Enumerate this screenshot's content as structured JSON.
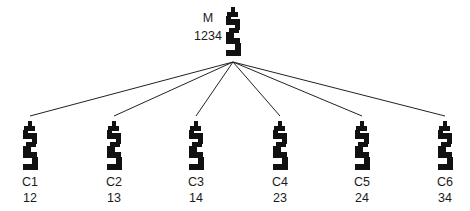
{
  "root": {
    "label": "M",
    "value": "1234",
    "icon": "segment-glyph-icon"
  },
  "children": [
    {
      "label": "C1",
      "value": "12",
      "icon": "segment-glyph-icon"
    },
    {
      "label": "C2",
      "value": "13",
      "icon": "segment-glyph-icon"
    },
    {
      "label": "C3",
      "value": "14",
      "icon": "segment-glyph-icon"
    },
    {
      "label": "C4",
      "value": "23",
      "icon": "segment-glyph-icon"
    },
    {
      "label": "C5",
      "value": "24",
      "icon": "segment-glyph-icon"
    },
    {
      "label": "C6",
      "value": "34",
      "icon": "segment-glyph-icon"
    }
  ],
  "colors": {
    "ink": "#111111",
    "edge": "#222222",
    "background": "#ffffff"
  }
}
